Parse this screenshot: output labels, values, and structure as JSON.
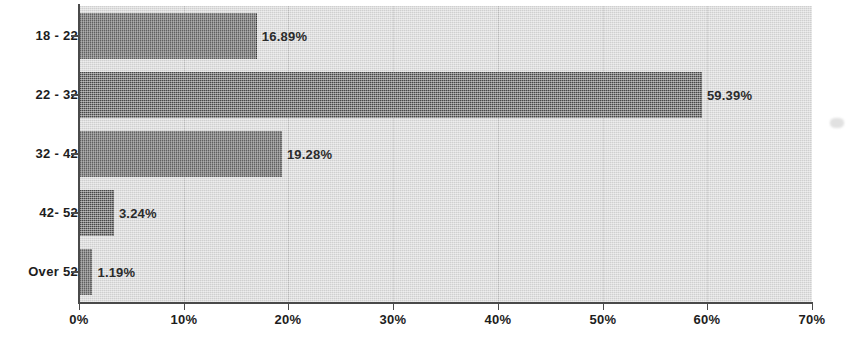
{
  "chart_data": {
    "type": "bar",
    "orientation": "horizontal",
    "title": "",
    "subtitle": "",
    "xlabel": "",
    "ylabel": "",
    "categories": [
      "18 - 22",
      "22 - 32",
      "32 - 42",
      "42- 52",
      "Over 52"
    ],
    "values": [
      16.89,
      59.39,
      19.28,
      3.24,
      1.19
    ],
    "value_labels": [
      "16.89%",
      "59.39%",
      "19.28%",
      "3.24%",
      "1.19%"
    ],
    "xlim": [
      0,
      70
    ],
    "x_ticks": [
      0,
      10,
      20,
      30,
      40,
      50,
      60,
      70
    ],
    "x_tick_labels": [
      "0%",
      "10%",
      "20%",
      "30%",
      "40%",
      "50%",
      "60%",
      "70%"
    ],
    "grid": true,
    "grid_axis": "x",
    "legend": false,
    "legend_position": "none",
    "series": [
      {
        "name": "Age distribution",
        "values": [
          16.89,
          59.39,
          19.28,
          3.24,
          1.19
        ]
      }
    ]
  },
  "colors": {
    "bar_fill": "#5c5c5c",
    "plot_background": "#dcdcdc",
    "gridline": "#c2c2c2",
    "axis": "#4a4a4a",
    "text": "#1d1d1d",
    "value_text": "#2b2b2b",
    "page_background": "#ffffff"
  }
}
